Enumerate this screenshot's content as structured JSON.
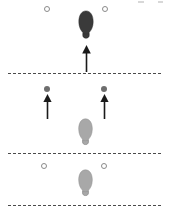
{
  "figure": {
    "background_color": "#ffffff",
    "width": 169,
    "height": 214,
    "colors": {
      "dashed_line": "#4a4a4a",
      "dark_footprint": "#3a3a3a",
      "light_footprint": "#a8a8a8",
      "light_footprint_stroke": "#8e8e8e",
      "filled_dot": "#6e6e6e",
      "open_circle_stroke": "#8a8a8a",
      "arrow": "#1a1a1a"
    }
  },
  "dashed_lines": [
    {
      "name": "line-top",
      "y": 73,
      "x_start": 8,
      "x_end": 161
    },
    {
      "name": "line-middle",
      "y": 153,
      "x_start": 8,
      "x_end": 161
    },
    {
      "name": "line-bottom",
      "y": 205,
      "x_start": 8,
      "x_end": 161
    }
  ],
  "open_circles": [
    {
      "name": "open-circle-top-left",
      "cx": 47,
      "cy": 9
    },
    {
      "name": "open-circle-top-right",
      "cx": 105,
      "cy": 9
    },
    {
      "name": "open-circle-bottom-left",
      "cx": 44,
      "cy": 166
    },
    {
      "name": "open-circle-bottom-right",
      "cx": 104,
      "cy": 166
    }
  ],
  "filled_dots": [
    {
      "name": "filled-dot-left",
      "cx": 47,
      "cy": 89
    },
    {
      "name": "filled-dot-right",
      "cx": 104,
      "cy": 89
    }
  ],
  "arrows": [
    {
      "name": "arrow-center-up",
      "x": 86,
      "y_tail": 70,
      "y_head": 45,
      "length": 25
    },
    {
      "name": "arrow-left-up",
      "x": 47,
      "y_tail": 117,
      "y_head": 94,
      "length": 23
    },
    {
      "name": "arrow-right-up",
      "x": 104,
      "y_tail": 117,
      "y_head": 94,
      "length": 23
    }
  ],
  "footprints": [
    {
      "name": "footprint-dark-top",
      "shade": "dark",
      "cx": 86,
      "cy": 28,
      "width": 18,
      "height": 36,
      "orientation": "up"
    },
    {
      "name": "footprint-light-middle",
      "shade": "light",
      "cx": 85,
      "cy": 135,
      "width": 17,
      "height": 36,
      "orientation": "up"
    },
    {
      "name": "footprint-light-bottom",
      "shade": "light",
      "cx": 85,
      "cy": 186,
      "width": 17,
      "height": 36,
      "orientation": "up"
    }
  ],
  "faint_marks": [
    {
      "name": "faint-mark-top-right-a",
      "x": 138,
      "y": 1,
      "width": 6,
      "height": 2
    },
    {
      "name": "faint-mark-top-right-b",
      "x": 158,
      "y": 1,
      "width": 5,
      "height": 2
    }
  ]
}
